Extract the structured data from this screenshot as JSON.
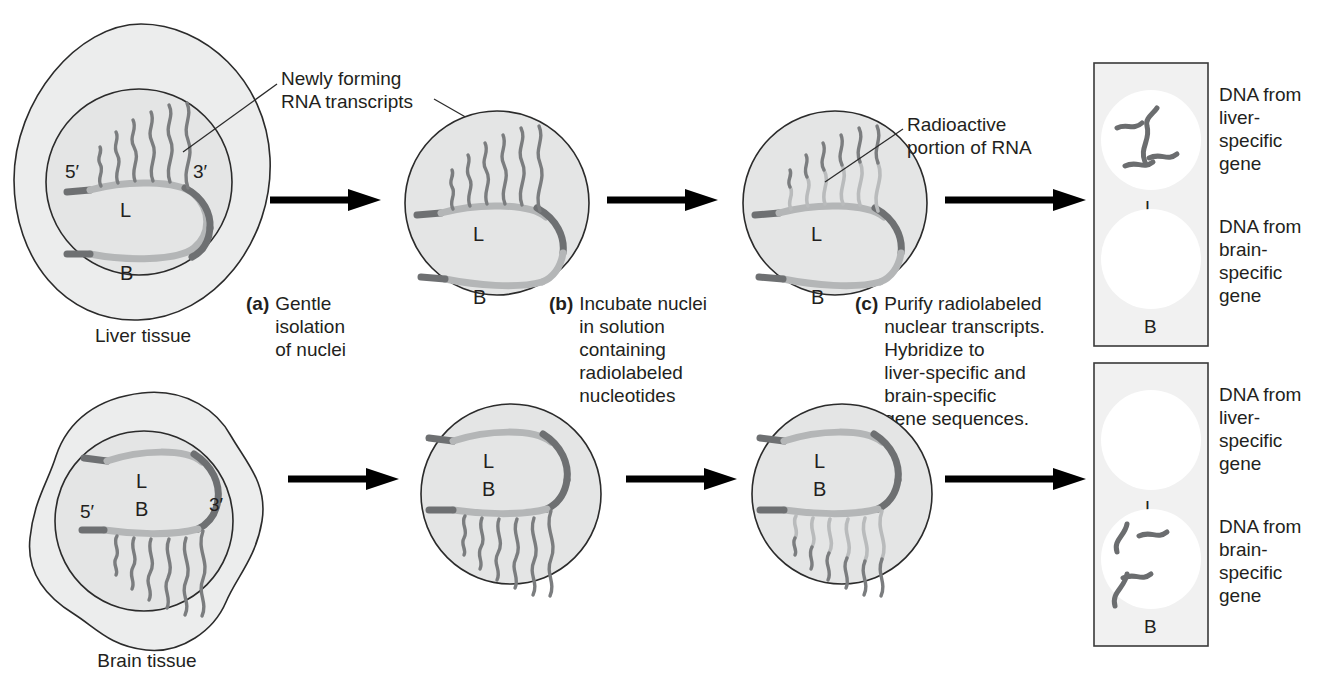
{
  "figure": {
    "type": "process-flow-diagram"
  },
  "annotations": {
    "newly_forming": "Newly forming\nRNA transcripts",
    "radioactive": "Radioactive\nportion of RNA"
  },
  "rows": [
    {
      "id": "liver",
      "tissue_label": "Liver tissue",
      "gene_labels": {
        "active": "L",
        "inactive": "B"
      },
      "end_labels": {
        "five_prime": "5′",
        "three_prime": "3′"
      },
      "blot": {
        "spots": [
          {
            "name": "L",
            "label": "L",
            "signal": true,
            "squiggle_count": 4
          },
          {
            "name": "B",
            "label": "B",
            "signal": false,
            "squiggle_count": 0
          }
        ],
        "right_labels": [
          "DNA from\nliver-\nspecific\ngene",
          "DNA from\nbrain-\nspecific\ngene"
        ]
      }
    },
    {
      "id": "brain",
      "tissue_label": "Brain tissue",
      "gene_labels": {
        "active": "B",
        "inactive": "L"
      },
      "end_labels": {
        "five_prime": "5′",
        "three_prime": "3′"
      },
      "blot": {
        "spots": [
          {
            "name": "L",
            "label": "L",
            "signal": false,
            "squiggle_count": 0
          },
          {
            "name": "B",
            "label": "B",
            "signal": true,
            "squiggle_count": 4
          }
        ],
        "right_labels": [
          "DNA from\nliver-\nspecific\ngene",
          "DNA from\nbrain-\nspecific\ngene"
        ]
      }
    }
  ],
  "steps": [
    {
      "letter": "(a)",
      "text": "Gentle\nisolation\nof nuclei"
    },
    {
      "letter": "(b)",
      "text": "Incubate nuclei\nin solution\ncontaining\nradiolabeled\nnucleotides"
    },
    {
      "letter": "(c)",
      "text": "Purify radiolabeled\nnuclear transcripts.\nHybridize to\nliver-specific and\nbrain-specific\ngene sequences."
    }
  ],
  "colors": {
    "cytoplasm": "#eceded",
    "nucleus": "#e4e5e5",
    "outline": "#2b2b2b",
    "dna_dark": "#6e7072",
    "dna_light": "#b4b6b7",
    "rna": "#7b7d7f",
    "rna_hot": "#b9bbbc",
    "blot_bg": "#f1f1f1",
    "blot_border": "#3a3a3a",
    "spot": "#ffffff",
    "squiggle": "#6b6d6f",
    "arrow": "#000000",
    "text": "#231f20"
  }
}
